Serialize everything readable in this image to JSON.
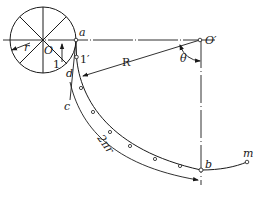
{
  "diagram": {
    "labels": {
      "r": "r",
      "O": "O",
      "a": "a",
      "one": "1",
      "one_prime": "1′",
      "d": "d",
      "c": "c",
      "R": "R",
      "O_prime": "O′",
      "theta": "θ",
      "two_pi_r": "2πr",
      "b": "b",
      "m": "m"
    },
    "colors": {
      "stroke": "#1a1a1a",
      "background": "#ffffff"
    }
  }
}
